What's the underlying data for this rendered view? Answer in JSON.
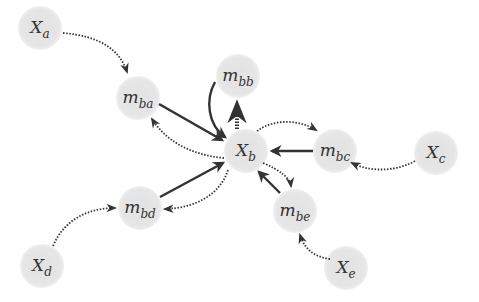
{
  "diagram": {
    "type": "factor-graph-message-passing",
    "colors": {
      "node_fill": "#e6e6e6",
      "edge": "#333333",
      "label": "#333333",
      "background": "#ffffff"
    },
    "nodes": [
      {
        "id": "Xa",
        "base": "X",
        "sub": "a",
        "kind": "variable",
        "cx": 40,
        "cy": 28,
        "r": 22
      },
      {
        "id": "mba",
        "base": "m",
        "sub": "ba",
        "kind": "message",
        "cx": 138,
        "cy": 98,
        "r": 22
      },
      {
        "id": "mbb",
        "base": "m",
        "sub": "bb",
        "kind": "message",
        "cx": 238,
        "cy": 76,
        "r": 22
      },
      {
        "id": "Xb",
        "base": "X",
        "sub": "b",
        "kind": "variable",
        "cx": 246,
        "cy": 151,
        "r": 22
      },
      {
        "id": "mbc",
        "base": "m",
        "sub": "bc",
        "kind": "message",
        "cx": 335,
        "cy": 151,
        "r": 22
      },
      {
        "id": "Xc",
        "base": "X",
        "sub": "c",
        "kind": "variable",
        "cx": 436,
        "cy": 153,
        "r": 22
      },
      {
        "id": "mbd",
        "base": "m",
        "sub": "bd",
        "kind": "message",
        "cx": 140,
        "cy": 208,
        "r": 22
      },
      {
        "id": "mbe",
        "base": "m",
        "sub": "be",
        "kind": "message",
        "cx": 295,
        "cy": 211,
        "r": 22
      },
      {
        "id": "Xd",
        "base": "X",
        "sub": "d",
        "kind": "variable",
        "cx": 42,
        "cy": 266,
        "r": 22
      },
      {
        "id": "Xe",
        "base": "X",
        "sub": "e",
        "kind": "variable",
        "cx": 346,
        "cy": 268,
        "r": 22
      }
    ],
    "edges": [
      {
        "from": "Xa",
        "to": "mba",
        "style": "dotted",
        "path": "M63,33 C100,36 120,50 127,72"
      },
      {
        "from": "mba",
        "to": "Xb",
        "style": "solid",
        "path": "M159,104 L222,140"
      },
      {
        "from": "Xb",
        "to": "mba",
        "style": "dotted",
        "path": "M224,158 C190,155 165,140 152,119"
      },
      {
        "from": "mbb",
        "to": "Xb",
        "style": "solid",
        "path": "M215,82 C205,100 208,125 225,137"
      },
      {
        "from": "Xb",
        "to": "mbb",
        "style": "dotted-thick",
        "path": "M237,129 L237,104"
      },
      {
        "from": "Xb",
        "to": "mbc",
        "style": "dotted",
        "path": "M257,131 C275,118 300,120 316,130"
      },
      {
        "from": "mbc",
        "to": "Xb",
        "style": "solid",
        "path": "M313,151 L272,151"
      },
      {
        "from": "Xc",
        "to": "mbc",
        "style": "dotted",
        "path": "M415,161 C395,172 370,172 352,163"
      },
      {
        "from": "mbd",
        "to": "Xb",
        "style": "solid",
        "path": "M160,197 L223,163"
      },
      {
        "from": "Xb",
        "to": "mbd",
        "style": "dotted",
        "path": "M228,170 C220,195 195,208 165,209"
      },
      {
        "from": "Xd",
        "to": "mbd",
        "style": "dotted",
        "path": "M53,246 C65,218 90,208 115,208"
      },
      {
        "from": "mbe",
        "to": "Xb",
        "style": "solid",
        "path": "M280,193 L259,172"
      },
      {
        "from": "Xb",
        "to": "mbe",
        "style": "dotted",
        "path": "M263,163 C280,170 290,178 291,186"
      },
      {
        "from": "Xe",
        "to": "mbe",
        "style": "dotted",
        "path": "M330,259 C315,257 305,250 300,235"
      }
    ]
  }
}
